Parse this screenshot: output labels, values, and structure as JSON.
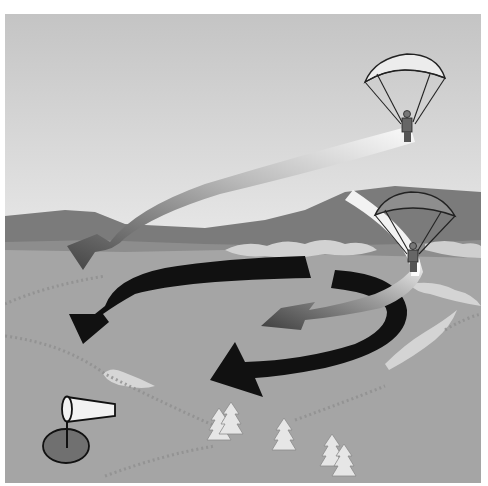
{
  "diagram": {
    "caption": "Paraglider landing approach illustration",
    "colors": {
      "sky_top": "#c9c9c9",
      "sky_bottom": "#f1f1f1",
      "mountain_far": "#7a7a7a",
      "mountain_near": "#8c8c8c",
      "ground": "#a4a4a4",
      "cloud": "#d4d4d4",
      "arrow_black": "#111111",
      "arrow_grey": "#555555",
      "canopy_light": "#ececec",
      "canopy_dark": "#8e8e8e",
      "target_circle": "#707070",
      "windsock": "#f2f2f2"
    },
    "elements": {
      "paraglider_high": "paraglider at altitude (light canopy)",
      "paraglider_low": "paraglider turning into landing (dark canopy)",
      "arrow_glide_path": "grey gradient glide-path arrow",
      "arrow_circuit_outer": "black circuit arrow (lower)",
      "arrow_circuit_upper": "black circuit arrow (upper)",
      "arrow_final": "grey gradient final approach arrow",
      "windsock": "windsock on pole",
      "landing_target": "landing target circle",
      "trees": "tree groups"
    }
  }
}
